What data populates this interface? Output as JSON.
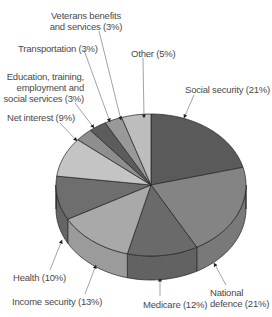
{
  "chart_data": {
    "type": "pie",
    "style": "3d-pie",
    "title": "",
    "legend": "none (callout labels with arrows)",
    "start_angle": "12 o'clock, clockwise",
    "slices": [
      {
        "label": "Social security",
        "value": 21,
        "color": "#5a5a5a"
      },
      {
        "label": "National defence",
        "value": 21,
        "color": "#848484"
      },
      {
        "label": "Medicare",
        "value": 12,
        "color": "#6a6a6a"
      },
      {
        "label": "Income security",
        "value": 13,
        "color": "#a9a9a9"
      },
      {
        "label": "Health",
        "value": 10,
        "color": "#6e6e6e"
      },
      {
        "label": "Net interest",
        "value": 9,
        "color": "#c4c4c4"
      },
      {
        "label": "Education, training, employment and social services",
        "value": 3,
        "color": "#8e8e8e"
      },
      {
        "label": "Transportation",
        "value": 3,
        "color": "#5c5c5c"
      },
      {
        "label": "Veterans benefits and services",
        "value": 3,
        "color": "#999999"
      },
      {
        "label": "Other",
        "value": 5,
        "color": "#bdbdbd"
      }
    ]
  },
  "labels": {
    "veterans_line1": "Veterans benefits",
    "veterans_line2": "and services (3%)",
    "transportation": "Transportation (3%)",
    "other": "Other (5%)",
    "education_line1": "Education, training,",
    "education_line2": "employment and",
    "education_line3": "social services (3%)",
    "social_security": "Social security (21%)",
    "net_interest": "Net interest (9%)",
    "health": "Health (10%)",
    "income_security": "Income security (13%)",
    "medicare": "Medicare (12%)",
    "national_line1": "National",
    "national_line2": "defence (21%)"
  }
}
